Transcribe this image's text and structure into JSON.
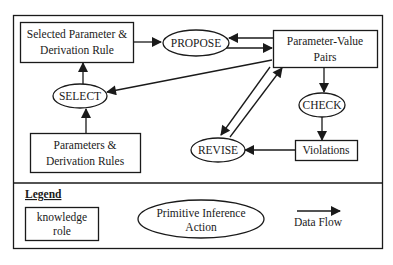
{
  "diagram": {
    "nodes": {
      "selected_param": {
        "type": "knowledge-role",
        "line1": "Selected Parameter &",
        "line2": "Derivation Rule"
      },
      "propose": {
        "type": "inference-action",
        "label": "PROPOSE"
      },
      "param_value_pairs": {
        "type": "knowledge-role",
        "line1": "Parameter-Value",
        "line2": "Pairs"
      },
      "select": {
        "type": "inference-action",
        "label": "SELECT"
      },
      "check": {
        "type": "inference-action",
        "label": "CHECK"
      },
      "params_rules": {
        "type": "knowledge-role",
        "line1": "Parameters &",
        "line2": "Derivation Rules"
      },
      "revise": {
        "type": "inference-action",
        "label": "REVISE"
      },
      "violations": {
        "type": "knowledge-role",
        "label": "Violations"
      }
    },
    "edges": [
      {
        "from": "Selected Parameter & Derivation Rule",
        "to": "PROPOSE"
      },
      {
        "from": "PROPOSE",
        "to": "Parameter-Value Pairs"
      },
      {
        "from": "Parameter-Value Pairs",
        "to": "PROPOSE"
      },
      {
        "from": "Parameter-Value Pairs",
        "to": "SELECT"
      },
      {
        "from": "SELECT",
        "to": "Selected Parameter & Derivation Rule"
      },
      {
        "from": "Parameters & Derivation Rules",
        "to": "SELECT"
      },
      {
        "from": "Parameter-Value Pairs",
        "to": "CHECK"
      },
      {
        "from": "CHECK",
        "to": "Violations"
      },
      {
        "from": "Violations",
        "to": "REVISE"
      },
      {
        "from": "Parameter-Value Pairs",
        "to": "REVISE"
      },
      {
        "from": "REVISE",
        "to": "Parameter-Value Pairs"
      }
    ]
  },
  "legend": {
    "title": "Legend",
    "knowledge_role": {
      "line1": "knowledge",
      "line2": "role"
    },
    "inference_action": {
      "line1": "Primitive Inference",
      "line2": "Action"
    },
    "data_flow": "Data Flow"
  }
}
